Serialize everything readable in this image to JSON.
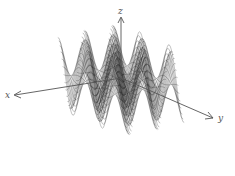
{
  "chart_data": {
    "type": "surface",
    "title": "",
    "function": "z = sin(x) * cos(y) style oscillating surface",
    "axes": {
      "x": "x",
      "y": "y",
      "z": "z"
    },
    "grid": false,
    "legend": null,
    "style": {
      "line_color": "#1a1a1a",
      "fill_color": "#ffffff",
      "axis_color": "#555555"
    },
    "surface": {
      "x_range": [
        -7.5,
        7.5
      ],
      "y_range": [
        -7.5,
        7.5
      ],
      "x_steps": 24,
      "y_steps": 70,
      "amplitude": 1.0
    }
  },
  "labels": {
    "x": "x",
    "y": "y",
    "z": "z"
  }
}
